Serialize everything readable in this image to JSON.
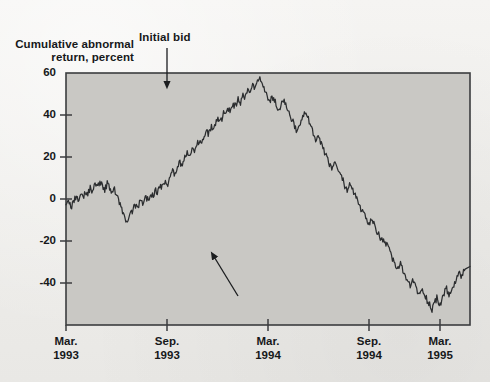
{
  "figure": {
    "background_color": "#f1f0ed",
    "plot_fill_color": "#c9c8c4",
    "frame_color": "#3b3d3f",
    "line_color": "#2b2d2f",
    "text_color": "#16181a"
  },
  "axis": {
    "y_label": "Cumulative abnormal\nreturn, percent",
    "y_label_line1": "Cumulative abnormal",
    "y_label_line2": "return, percent",
    "y_ticks": [
      "60",
      "40",
      "20",
      "0",
      "-20",
      "-40"
    ],
    "x_ticks": [
      {
        "month": "Mar.",
        "year": "1993"
      },
      {
        "month": "Sep.",
        "year": "1993"
      },
      {
        "month": "Mar.",
        "year": "1994"
      },
      {
        "month": "Sep.",
        "year": "1994"
      },
      {
        "month": "Mar.",
        "year": "1995"
      }
    ]
  },
  "annotations": {
    "initial_bid": "Initial bid",
    "final_bid": "Final bid accepted"
  },
  "chart_data": {
    "type": "line",
    "title": "",
    "subtitle": "",
    "xlabel": "",
    "ylabel": "Cumulative abnormal return, percent",
    "xlim": [
      "Mar. 1993",
      "Mar. 1995"
    ],
    "ylim": [
      -52,
      60
    ],
    "ytick_values": [
      60,
      40,
      20,
      0,
      -20,
      -40
    ],
    "xtick_labels": [
      "Mar. 1993",
      "Sep. 1993",
      "Mar. 1994",
      "Sep. 1994",
      "Mar. 1995"
    ],
    "grid": false,
    "legend": "none",
    "annotations": [
      {
        "text": "Initial bid",
        "points_to_x": 0.465,
        "points_to_value": 56,
        "arrow": "down"
      },
      {
        "text": "Final bid accepted",
        "points_to_x": 0.545,
        "points_to_value": -27,
        "arrow": "up-left"
      }
    ],
    "series": [
      {
        "name": "Cumulative abnormal return",
        "x_fraction": [
          0.0,
          0.006,
          0.012,
          0.018,
          0.024,
          0.03,
          0.036,
          0.042,
          0.048,
          0.054,
          0.06,
          0.066,
          0.072,
          0.078,
          0.084,
          0.09,
          0.096,
          0.102,
          0.108,
          0.114,
          0.12,
          0.126,
          0.132,
          0.138,
          0.144,
          0.15,
          0.156,
          0.162,
          0.168,
          0.174,
          0.18,
          0.186,
          0.192,
          0.198,
          0.204,
          0.21,
          0.216,
          0.222,
          0.228,
          0.234,
          0.24,
          0.246,
          0.252,
          0.258,
          0.264,
          0.27,
          0.276,
          0.282,
          0.288,
          0.294,
          0.3,
          0.306,
          0.312,
          0.318,
          0.324,
          0.33,
          0.336,
          0.342,
          0.348,
          0.354,
          0.36,
          0.366,
          0.372,
          0.378,
          0.384,
          0.39,
          0.396,
          0.402,
          0.408,
          0.414,
          0.42,
          0.426,
          0.432,
          0.438,
          0.444,
          0.45,
          0.456,
          0.462,
          0.468,
          0.474,
          0.48,
          0.486,
          0.492,
          0.498,
          0.504,
          0.51,
          0.516,
          0.522,
          0.528,
          0.534,
          0.54,
          0.546,
          0.552,
          0.558,
          0.564,
          0.57,
          0.576,
          0.582,
          0.588,
          0.594,
          0.6,
          0.606,
          0.612,
          0.618,
          0.624,
          0.63,
          0.636,
          0.642,
          0.648,
          0.654,
          0.66,
          0.666,
          0.672,
          0.678,
          0.684,
          0.69,
          0.696,
          0.702,
          0.708,
          0.714,
          0.72,
          0.726,
          0.732,
          0.738,
          0.744,
          0.75,
          0.756,
          0.762,
          0.768,
          0.774,
          0.78,
          0.786,
          0.792,
          0.798,
          0.804,
          0.81,
          0.816,
          0.822,
          0.828,
          0.834,
          0.84,
          0.846,
          0.852,
          0.858,
          0.864,
          0.87,
          0.876,
          0.882,
          0.888,
          0.894,
          0.9,
          0.906,
          0.912,
          0.918,
          0.924,
          0.93,
          0.936,
          0.942,
          0.948,
          0.954,
          0.96,
          0.966,
          0.972,
          0.978,
          0.984,
          0.99,
          0.996,
          1.0
        ],
        "values": [
          1,
          3,
          0,
          2,
          5,
          3,
          6,
          4,
          7,
          6,
          9,
          7,
          11,
          9,
          12,
          10,
          8,
          11,
          9,
          6,
          8,
          5,
          2,
          -1,
          -4,
          -7,
          -5,
          -2,
          0,
          2,
          1,
          4,
          2,
          5,
          3,
          6,
          5,
          8,
          7,
          10,
          9,
          12,
          11,
          14,
          16,
          15,
          18,
          20,
          19,
          22,
          24,
          23,
          26,
          25,
          28,
          30,
          29,
          32,
          34,
          33,
          36,
          35,
          38,
          40,
          39,
          42,
          41,
          44,
          43,
          46,
          45,
          48,
          47,
          50,
          49,
          52,
          51,
          54,
          53,
          56,
          57,
          55,
          52,
          49,
          47,
          50,
          48,
          45,
          43,
          46,
          48,
          45,
          42,
          40,
          37,
          34,
          36,
          38,
          41,
          43,
          40,
          36,
          33,
          30,
          32,
          29,
          26,
          24,
          21,
          19,
          17,
          20,
          18,
          15,
          13,
          10,
          8,
          11,
          9,
          6,
          4,
          1,
          -1,
          -3,
          -6,
          -8,
          -5,
          -7,
          -10,
          -12,
          -15,
          -13,
          -16,
          -18,
          -21,
          -23,
          -26,
          -27,
          -25,
          -28,
          -30,
          -33,
          -35,
          -32,
          -34,
          -37,
          -39,
          -36,
          -38,
          -41,
          -43,
          -45,
          -42,
          -40,
          -43,
          -41,
          -38,
          -36,
          -39,
          -37,
          -34,
          -32,
          -29,
          -31,
          -28,
          -26
        ]
      },
      {
        "name": "Cumulative abnormal return (continued)",
        "x_fraction": [],
        "values": []
      }
    ],
    "key_features": {
      "start_value": 1,
      "early_peak": 12,
      "early_trough": -7,
      "max_value": 57,
      "max_at": "Sep. 1993",
      "min_value": -45,
      "min_at": "mid 1994",
      "late_peak": 5,
      "end_value": -8
    }
  }
}
